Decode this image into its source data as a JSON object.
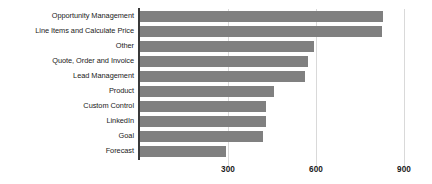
{
  "chart_data": {
    "type": "bar",
    "orientation": "horizontal",
    "title": "",
    "subtitle": "",
    "xlabel": "",
    "ylabel": "",
    "categories": [
      "Opportunity Management",
      "Line Items and Calculate Price",
      "Other",
      "Quote, Order and Invoice",
      "Lead Management",
      "Product",
      "Custom Control",
      "LinkedIn",
      "Goal",
      "Forecast"
    ],
    "values": [
      828,
      825,
      593,
      572,
      562,
      457,
      430,
      430,
      419,
      293
    ],
    "xlim": [
      0,
      900
    ],
    "xticks": [
      300,
      600,
      900
    ],
    "xtick_labels": [
      "300",
      "600",
      "900"
    ],
    "grid": true,
    "grid_axis": "x",
    "legend": false,
    "legend_position": "none",
    "colors": {
      "bar_fill": "#808080",
      "gridline": "#d9d9d9",
      "axis_spine": "#3a3a3a",
      "text": "#1a1a1a",
      "background": "#ffffff"
    }
  }
}
